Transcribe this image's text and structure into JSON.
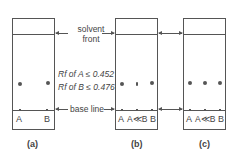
{
  "diagram": {
    "labels": {
      "solvent_front": [
        "solvent",
        "front"
      ],
      "base_line": "base line",
      "rf_a": "Rf of A ≤ 0.452",
      "rf_b": "Rf of B ≤ 0.476"
    },
    "plates": [
      {
        "caption": "(a)",
        "lanes": [
          "A",
          "B"
        ]
      },
      {
        "caption": "(b)",
        "lanes": [
          "A",
          "A≪B",
          "B"
        ]
      },
      {
        "caption": "(c)",
        "lanes": [
          "A",
          "A≪B",
          "B"
        ]
      }
    ]
  }
}
